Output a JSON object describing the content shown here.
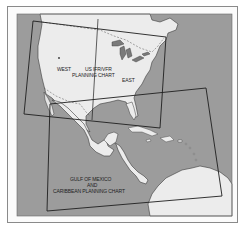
{
  "figure": {
    "type": "chart-coverage-map",
    "colors": {
      "water": "#9a9a9a",
      "land": "#ececec",
      "outline": "#2a2a2a",
      "frame": "#8a8a8a",
      "background": "#ffffff"
    }
  },
  "charts": [
    {
      "id": "us-ifr-vfr",
      "label_line1": "US IFR/VFR",
      "label_line2": "PLANNING CHART",
      "sections": [
        {
          "id": "west",
          "label": "WEST"
        },
        {
          "id": "east",
          "label": "EAST"
        }
      ]
    },
    {
      "id": "gulf-caribbean",
      "label_line1": "GULF OF MEXICO",
      "label_line2": "AND",
      "label_line3": "CARIBBEAN PLANNING CHART"
    }
  ]
}
